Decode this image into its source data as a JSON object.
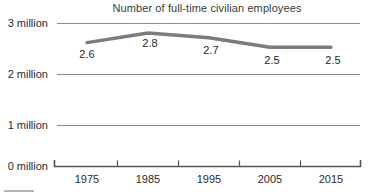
{
  "chart_data": {
    "type": "line",
    "title": "Number of full-time civilian employees",
    "xlabel": "",
    "ylabel": "",
    "categories": [
      "1975",
      "1985",
      "1995",
      "2005",
      "2015"
    ],
    "x": [
      1975,
      1985,
      1995,
      2005,
      2015
    ],
    "values": [
      2.6,
      2.8,
      2.7,
      2.5,
      2.5
    ],
    "value_labels": [
      "2.6",
      "2.8",
      "2.7",
      "2.5",
      "2.5"
    ],
    "units": "million",
    "ylim": [
      0,
      3
    ],
    "y_ticks": [
      0,
      1,
      2,
      3
    ],
    "y_tick_labels": [
      "0 million",
      "1 million",
      "2 million",
      "3 million"
    ],
    "x_tick_labels": [
      "1975",
      "1985",
      "1995",
      "2005",
      "2015"
    ],
    "grid": true,
    "legend": false,
    "series": [
      {
        "name": "Full-time civilian employees",
        "values": [
          2.6,
          2.8,
          2.7,
          2.5,
          2.5
        ]
      }
    ],
    "colors": {
      "line": "#7c7c7c",
      "grid": "#8f8f8f",
      "axis": "#555555",
      "text": "#2b2b2b",
      "title": "#3a3a3a",
      "background": "#ffffff"
    }
  }
}
